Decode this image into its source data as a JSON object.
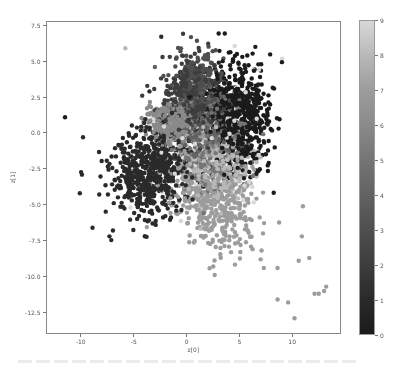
{
  "chart_data": {
    "type": "scatter",
    "title": "",
    "xlabel": "z[0]",
    "ylabel": "z[1]",
    "xlim": [
      -13.3,
      14.6
    ],
    "ylim": [
      -14.0,
      7.8
    ],
    "xticks": [
      -10,
      -5,
      0,
      5,
      10
    ],
    "xtick_labels": [
      "-10",
      "-5",
      "0",
      "5",
      "10"
    ],
    "yticks": [
      7.5,
      5.0,
      2.5,
      0.0,
      -2.5,
      -5.0,
      -7.5,
      -10.0,
      -12.5
    ],
    "ytick_labels": [
      "7.5",
      "5.0",
      "2.5",
      "0.0",
      "-2.5",
      "-5.0",
      "-7.5",
      "-10.0",
      "-12.5"
    ],
    "grid": false,
    "colormap": "gray",
    "colorbar": {
      "min": 0,
      "max": 9,
      "ticks": [
        0,
        1,
        2,
        3,
        4,
        5,
        6,
        7,
        8,
        9
      ],
      "tick_labels": [
        "0",
        "1",
        "2",
        "3",
        "4",
        "5",
        "6",
        "7",
        "8",
        "9"
      ]
    },
    "marker_radius_px": 2.2,
    "series": [
      {
        "name": "0",
        "color": "#1b1b1b",
        "center": [
          4.8,
          1.2
        ],
        "spread": [
          1.5,
          1.9
        ],
        "rotation": 0.35,
        "count": 700
      },
      {
        "name": "1",
        "color": "#2a2a2a",
        "center": [
          -3.2,
          -2.6
        ],
        "spread": [
          1.9,
          1.5
        ],
        "rotation": 0.45,
        "count": 650
      },
      {
        "name": "2",
        "color": "#3d3d3d",
        "center": [
          0.2,
          2.2
        ],
        "spread": [
          1.2,
          1.4
        ],
        "rotation": 0.2,
        "count": 380
      },
      {
        "name": "3",
        "color": "#4f4f4f",
        "center": [
          1.2,
          3.0
        ],
        "spread": [
          1.2,
          1.2
        ],
        "rotation": 0.0,
        "count": 260
      },
      {
        "name": "4",
        "color": "#626262",
        "center": [
          1.5,
          0.5
        ],
        "spread": [
          1.3,
          1.3
        ],
        "rotation": 0.0,
        "count": 260
      },
      {
        "name": "5",
        "color": "#757575",
        "center": [
          2.4,
          -1.2
        ],
        "spread": [
          1.5,
          1.5
        ],
        "rotation": 0.3,
        "count": 260
      },
      {
        "name": "6",
        "color": "#8a8a8a",
        "center": [
          -1.4,
          0.8
        ],
        "spread": [
          1.1,
          0.7
        ],
        "rotation": 0.0,
        "count": 330
      },
      {
        "name": "7",
        "color": "#9c9c9c",
        "center": [
          2.2,
          -4.2
        ],
        "spread": [
          2.4,
          1.6
        ],
        "rotation": -0.55,
        "count": 560
      },
      {
        "name": "8",
        "color": "#b8b8b8",
        "center": [
          3.0,
          -2.2
        ],
        "spread": [
          1.5,
          1.5
        ],
        "rotation": 0.0,
        "count": 240
      },
      {
        "name": "9",
        "color": "#d8d8d8",
        "center": [
          2.0,
          -1.0
        ],
        "spread": [
          2.4,
          2.2
        ],
        "rotation": 0.0,
        "count": 90
      }
    ],
    "outliers": [
      {
        "x": -11.5,
        "y": 1.1,
        "class": 0
      },
      {
        "x": -9.8,
        "y": -0.3,
        "class": 1
      },
      {
        "x": -9.9,
        "y": -2.9,
        "class": 1
      },
      {
        "x": -10.1,
        "y": -4.2,
        "class": 1
      },
      {
        "x": -8.9,
        "y": -6.6,
        "class": 1
      },
      {
        "x": -7.3,
        "y": -7.2,
        "class": 1
      },
      {
        "x": -5.8,
        "y": 5.9,
        "class": 8
      },
      {
        "x": -2.4,
        "y": 6.7,
        "class": 1
      },
      {
        "x": -3.0,
        "y": 4.6,
        "class": 4
      },
      {
        "x": -4.2,
        "y": 2.6,
        "class": 2
      },
      {
        "x": 6.5,
        "y": 6.0,
        "class": 0
      },
      {
        "x": 7.6,
        "y": 1.6,
        "class": 0
      },
      {
        "x": 7.8,
        "y": 0.8,
        "class": 0
      },
      {
        "x": 7.0,
        "y": -0.9,
        "class": 0
      },
      {
        "x": 13.2,
        "y": -10.7,
        "class": 7
      },
      {
        "x": 12.5,
        "y": -11.2,
        "class": 7
      },
      {
        "x": 12.1,
        "y": -11.2,
        "class": 7
      },
      {
        "x": 13.0,
        "y": -11.0,
        "class": 7
      },
      {
        "x": 10.2,
        "y": -12.9,
        "class": 7
      },
      {
        "x": 9.6,
        "y": -11.8,
        "class": 7
      },
      {
        "x": 8.6,
        "y": -11.6,
        "class": 7
      },
      {
        "x": 8.6,
        "y": -9.4,
        "class": 7
      },
      {
        "x": 10.6,
        "y": -8.9,
        "class": 7
      },
      {
        "x": 11.6,
        "y": -8.7,
        "class": 7
      },
      {
        "x": 10.9,
        "y": -7.2,
        "class": 7
      },
      {
        "x": 7.3,
        "y": -9.4,
        "class": 7
      },
      {
        "x": 7.0,
        "y": -8.8,
        "class": 7
      },
      {
        "x": 4.2,
        "y": -8.3,
        "class": 7
      },
      {
        "x": 5.1,
        "y": -7.8,
        "class": 7
      },
      {
        "x": 3.1,
        "y": -7.5,
        "class": 7
      },
      {
        "x": 11.0,
        "y": -5.1,
        "class": 7
      }
    ],
    "seed": 42
  },
  "layout": {
    "axes": {
      "left": 46,
      "top": 21,
      "right": 341,
      "bottom": 334
    },
    "colorbar": {
      "left": 359,
      "top": 20,
      "right": 375,
      "bottom": 335
    }
  }
}
